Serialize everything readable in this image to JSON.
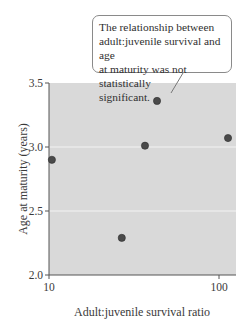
{
  "chart_data": {
    "type": "scatter",
    "title": "",
    "xlabel": "Adult:juvenile survival ratio",
    "ylabel": "Age at maturity (years)",
    "xscale": "log",
    "xlim": [
      10,
      115
    ],
    "ylim": [
      2.0,
      3.5
    ],
    "x_ticks": [
      10,
      100
    ],
    "x_tick_labels": [
      "10",
      "100"
    ],
    "y_ticks": [
      2.0,
      2.5,
      3.0,
      3.5
    ],
    "y_tick_labels": [
      "2.0",
      "2.5",
      "3.0",
      "3.5"
    ],
    "grid": "horizontal white lines at 2.5 and 3.0",
    "plot_background": "#d9d9d9",
    "point_color": "#4a4a4a",
    "points": [
      {
        "x": 10.4,
        "y": 2.9
      },
      {
        "x": 26.8,
        "y": 2.29
      },
      {
        "x": 36.7,
        "y": 3.01
      },
      {
        "x": 43.2,
        "y": 3.36
      },
      {
        "x": 113,
        "y": 3.07
      }
    ],
    "annotations": [
      {
        "text": "The relationship between adult:juvenile survival and age at maturity was not statistically significant.",
        "points_to": [
          50,
          3.38
        ]
      }
    ],
    "legend": null
  },
  "callout": {
    "lines": [
      "The relationship between",
      "adult:juvenile survival and age",
      "at maturity was not statistically",
      "significant."
    ]
  },
  "axes": {
    "xlabel": "Adult:juvenile survival ratio",
    "ylabel": "Age at maturity (years)"
  }
}
